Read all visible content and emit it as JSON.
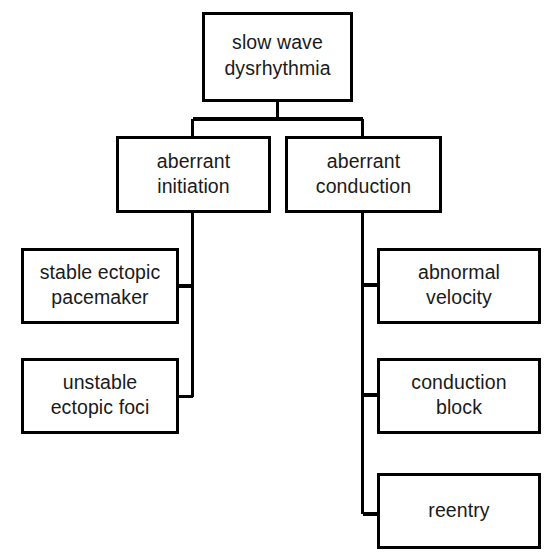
{
  "diagram": {
    "type": "hierarchy-tree",
    "orientation": "top-down-with-side-branches",
    "colors": {
      "background": "#ffffff",
      "box_fill": "#ffffff",
      "box_stroke": "#000000",
      "text": "#1a1a1a",
      "connector": "#000000"
    },
    "nodes": {
      "root": {
        "id": "slow-wave-dysrhythmia",
        "line1": "slow wave",
        "line2": "dysrhythmia",
        "level": 0
      },
      "branch_left": {
        "id": "aberrant-initiation",
        "line1": "aberrant",
        "line2": "initiation",
        "level": 1
      },
      "branch_right": {
        "id": "aberrant-conduction",
        "line1": "aberrant",
        "line2": "conduction",
        "level": 1
      },
      "leaf_left_1": {
        "id": "stable-ectopic-pacemaker",
        "line1": "stable ectopic",
        "line2": "pacemaker",
        "level": 2,
        "parent": "aberrant-initiation"
      },
      "leaf_left_2": {
        "id": "unstable-ectopic-foci",
        "line1": "unstable",
        "line2": "ectopic foci",
        "level": 2,
        "parent": "aberrant-initiation"
      },
      "leaf_right_1": {
        "id": "abnormal-velocity",
        "line1": "abnormal",
        "line2": "velocity",
        "level": 2,
        "parent": "aberrant-conduction"
      },
      "leaf_right_2": {
        "id": "conduction-block",
        "line1": "conduction",
        "line2": "block",
        "level": 2,
        "parent": "aberrant-conduction"
      },
      "leaf_right_3": {
        "id": "reentry",
        "line1": "reentry",
        "line2": "",
        "level": 2,
        "parent": "aberrant-conduction"
      }
    }
  }
}
